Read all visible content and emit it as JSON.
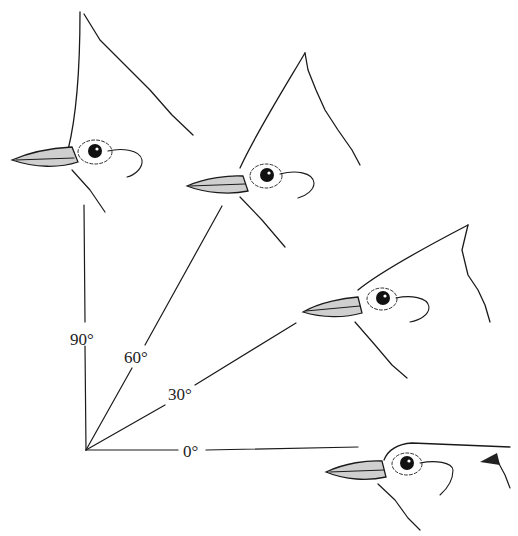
{
  "diagram": {
    "type": "crest-angle-illustration",
    "origin": {
      "x": 86,
      "y": 450
    },
    "angles": [
      {
        "label": "90°",
        "degrees": 90
      },
      {
        "label": "60°",
        "degrees": 60
      },
      {
        "label": "30°",
        "degrees": 30
      },
      {
        "label": "0°",
        "degrees": 0
      }
    ],
    "heads": [
      {
        "crest_angle": "90°"
      },
      {
        "crest_angle": "60°"
      },
      {
        "crest_angle": "30°"
      },
      {
        "crest_angle": "0°"
      }
    ],
    "colors": {
      "ink": "#1a1a1a",
      "beak_fill": "#cfcfcf",
      "background": "#ffffff"
    }
  }
}
